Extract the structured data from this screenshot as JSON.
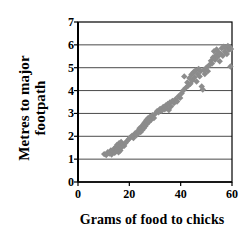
{
  "chart_data": {
    "type": "scatter",
    "title": "",
    "xlabel": "Grams of food to chicks",
    "ylabel_lines": [
      "Metres to major",
      "footpath"
    ],
    "ylabel": "Metres to major footpath",
    "xlim": [
      0,
      60
    ],
    "ylim": [
      0,
      7
    ],
    "xticks": [
      0,
      20,
      40,
      60
    ],
    "yticks": [
      0,
      1,
      2,
      3,
      4,
      5,
      6,
      7
    ],
    "xtick_labels": [
      "0",
      "20",
      "40",
      "60"
    ],
    "ytick_labels": [
      "0",
      "1",
      "2",
      "3",
      "4",
      "5",
      "6",
      "7"
    ],
    "grid": {
      "horizontal": true,
      "vertical": false,
      "at": [
        1,
        2,
        3,
        4,
        5,
        6
      ]
    },
    "legend": {
      "visible": false,
      "position": "none"
    },
    "marker": {
      "shape": "diamond",
      "color": "#8c8c8c",
      "size": 4
    },
    "frame": {
      "visible": true,
      "color": "#000000"
    },
    "series": [
      {
        "name": "chick food vs footpath distance",
        "color": "#8c8c8c",
        "points": [
          [
            10.2,
            1.22
          ],
          [
            11.0,
            1.18
          ],
          [
            11.6,
            1.3
          ],
          [
            12.2,
            1.25
          ],
          [
            12.8,
            1.38
          ],
          [
            13.1,
            1.2
          ],
          [
            13.6,
            1.33
          ],
          [
            14.0,
            1.45
          ],
          [
            14.3,
            1.28
          ],
          [
            14.7,
            1.52
          ],
          [
            15.0,
            1.35
          ],
          [
            15.2,
            1.62
          ],
          [
            15.4,
            1.42
          ],
          [
            15.6,
            1.55
          ],
          [
            15.8,
            1.3
          ],
          [
            16.0,
            1.7
          ],
          [
            16.1,
            1.48
          ],
          [
            16.3,
            1.6
          ],
          [
            16.5,
            1.38
          ],
          [
            16.8,
            1.75
          ],
          [
            17.0,
            1.52
          ],
          [
            17.4,
            1.66
          ],
          [
            18.0,
            1.58
          ],
          [
            18.6,
            1.72
          ],
          [
            19.2,
            1.8
          ],
          [
            19.8,
            1.88
          ],
          [
            20.4,
            1.95
          ],
          [
            21.0,
            2.02
          ],
          [
            21.6,
            1.92
          ],
          [
            22.2,
            2.12
          ],
          [
            22.8,
            2.05
          ],
          [
            23.2,
            2.22
          ],
          [
            23.6,
            2.15
          ],
          [
            24.0,
            2.35
          ],
          [
            24.4,
            2.18
          ],
          [
            24.8,
            2.42
          ],
          [
            25.1,
            2.28
          ],
          [
            25.4,
            2.52
          ],
          [
            25.7,
            2.36
          ],
          [
            26.0,
            2.6
          ],
          [
            26.3,
            2.45
          ],
          [
            26.6,
            2.7
          ],
          [
            26.9,
            2.55
          ],
          [
            27.2,
            2.78
          ],
          [
            27.6,
            2.62
          ],
          [
            28.0,
            2.85
          ],
          [
            28.5,
            2.72
          ],
          [
            29.0,
            2.92
          ],
          [
            29.6,
            2.8
          ],
          [
            30.2,
            3.0
          ],
          [
            30.8,
            3.1
          ],
          [
            31.4,
            3.05
          ],
          [
            32.0,
            3.2
          ],
          [
            32.6,
            3.12
          ],
          [
            33.2,
            3.28
          ],
          [
            33.8,
            3.18
          ],
          [
            34.2,
            3.35
          ],
          [
            34.6,
            3.22
          ],
          [
            35.0,
            3.42
          ],
          [
            35.4,
            3.15
          ],
          [
            35.8,
            3.48
          ],
          [
            36.2,
            3.3
          ],
          [
            36.8,
            3.55
          ],
          [
            37.4,
            3.45
          ],
          [
            38.0,
            3.62
          ],
          [
            38.6,
            3.52
          ],
          [
            39.2,
            3.75
          ],
          [
            39.8,
            3.68
          ],
          [
            40.4,
            3.88
          ],
          [
            41.0,
            4.0
          ],
          [
            41.4,
            4.62
          ],
          [
            42.0,
            4.12
          ],
          [
            42.6,
            4.35
          ],
          [
            43.0,
            4.22
          ],
          [
            43.4,
            4.55
          ],
          [
            43.8,
            4.3
          ],
          [
            44.2,
            4.7
          ],
          [
            44.6,
            4.45
          ],
          [
            45.0,
            4.8
          ],
          [
            45.4,
            4.58
          ],
          [
            45.8,
            4.88
          ],
          [
            46.2,
            4.4
          ],
          [
            46.6,
            4.72
          ],
          [
            47.0,
            4.95
          ],
          [
            47.4,
            4.62
          ],
          [
            47.8,
            4.85
          ],
          [
            48.2,
            4.18
          ],
          [
            48.6,
            4.05
          ],
          [
            49.0,
            4.9
          ],
          [
            49.4,
            4.72
          ],
          [
            50.0,
            5.0
          ],
          [
            50.6,
            4.85
          ],
          [
            51.2,
            5.12
          ],
          [
            51.8,
            5.3
          ],
          [
            52.2,
            5.18
          ],
          [
            52.6,
            5.45
          ],
          [
            53.0,
            5.72
          ],
          [
            53.4,
            5.35
          ],
          [
            53.8,
            5.55
          ],
          [
            54.0,
            5.8
          ],
          [
            54.4,
            5.48
          ],
          [
            54.8,
            5.68
          ],
          [
            55.2,
            5.28
          ],
          [
            55.6,
            5.6
          ],
          [
            56.0,
            5.85
          ],
          [
            56.4,
            5.52
          ],
          [
            56.8,
            5.92
          ],
          [
            57.2,
            5.7
          ],
          [
            57.6,
            5.88
          ],
          [
            58.0,
            5.6
          ],
          [
            58.4,
            5.95
          ],
          [
            58.8,
            5.78
          ],
          [
            59.2,
            5.9
          ],
          [
            59.4,
            5.05
          ],
          [
            59.6,
            5.82
          ]
        ]
      }
    ]
  }
}
